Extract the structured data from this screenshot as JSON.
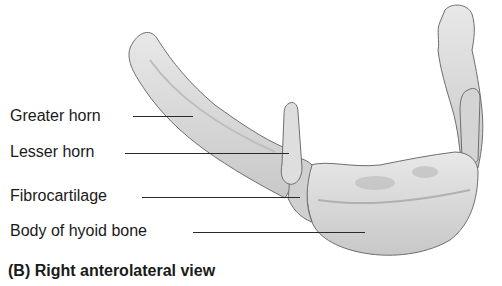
{
  "figure": {
    "caption": "(B) Right anterolateral view",
    "labels": [
      {
        "id": "greater-horn",
        "text": "Greater horn"
      },
      {
        "id": "lesser-horn",
        "text": "Lesser horn"
      },
      {
        "id": "fibrocartilage",
        "text": "Fibrocartilage"
      },
      {
        "id": "body-of-hyoid-bone",
        "text": "Body of hyoid bone"
      }
    ],
    "colors": {
      "bone_fill": "#dcdcdc",
      "bone_outline": "#6e6e6e",
      "bone_shadow": "#b4b4b4",
      "text": "#1a1a1a"
    }
  }
}
